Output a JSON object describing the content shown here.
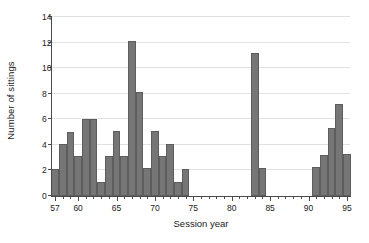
{
  "chart_data": {
    "type": "bar",
    "title": "",
    "subtitle": "",
    "xlabel": "Session year",
    "ylabel": "Number of sittings",
    "xlim": [
      56.6,
      95.4
    ],
    "ylim": [
      0,
      14
    ],
    "yticks": [
      0,
      2,
      4,
      6,
      8,
      10,
      12,
      14
    ],
    "xticks_major": [
      57,
      60,
      65,
      70,
      75,
      80,
      85,
      90,
      95
    ],
    "xtick_labels": [
      "57",
      "60",
      "65",
      "70",
      "75",
      "80",
      "85",
      "90",
      "95"
    ],
    "xticks_minor_step": 1,
    "grid": "horizontal",
    "legend": null,
    "bar_color": "#767676",
    "bar_edge_color": "#5d5d5d",
    "grid_color": "#e2e2e2",
    "axis_color": "#4a4a4a",
    "bar_width_years": 1,
    "categories": [
      "57",
      "58",
      "59",
      "60",
      "61",
      "62",
      "63",
      "64",
      "65",
      "66",
      "67",
      "68",
      "69",
      "70",
      "71",
      "72",
      "73",
      "74",
      "83",
      "84",
      "91",
      "92",
      "93",
      "94"
    ],
    "values": [
      2.1,
      4.1,
      5.0,
      3.1,
      6.0,
      6.0,
      1.1,
      3.1,
      5.1,
      3.1,
      12.1,
      8.1,
      2.2,
      5.1,
      3.1,
      4.1,
      1.1,
      2.1,
      11.2,
      2.2,
      2.3,
      3.2,
      5.3,
      7.2
    ],
    "bars": [
      {
        "x": 57,
        "value": 2.1
      },
      {
        "x": 58,
        "value": 4.1
      },
      {
        "x": 59,
        "value": 5.0
      },
      {
        "x": 60,
        "value": 3.1
      },
      {
        "x": 61,
        "value": 6.0
      },
      {
        "x": 62,
        "value": 6.0
      },
      {
        "x": 63,
        "value": 1.1
      },
      {
        "x": 64,
        "value": 3.1
      },
      {
        "x": 65,
        "value": 5.1
      },
      {
        "x": 66,
        "value": 3.1
      },
      {
        "x": 67,
        "value": 12.1
      },
      {
        "x": 68,
        "value": 8.1
      },
      {
        "x": 69,
        "value": 2.2
      },
      {
        "x": 70,
        "value": 5.1
      },
      {
        "x": 71,
        "value": 3.1
      },
      {
        "x": 72,
        "value": 4.1
      },
      {
        "x": 73,
        "value": 1.1
      },
      {
        "x": 74,
        "value": 2.1
      },
      {
        "x": 83,
        "value": 11.2
      },
      {
        "x": 84,
        "value": 2.2
      },
      {
        "x": 91,
        "value": 2.3
      },
      {
        "x": 92,
        "value": 3.2
      },
      {
        "x": 93,
        "value": 5.3
      },
      {
        "x": 94,
        "value": 7.2
      },
      {
        "x": 95,
        "value": 3.3
      }
    ],
    "gaps": [
      {
        "from": 75,
        "to": 82
      },
      {
        "from": 85,
        "to": 90
      }
    ]
  }
}
